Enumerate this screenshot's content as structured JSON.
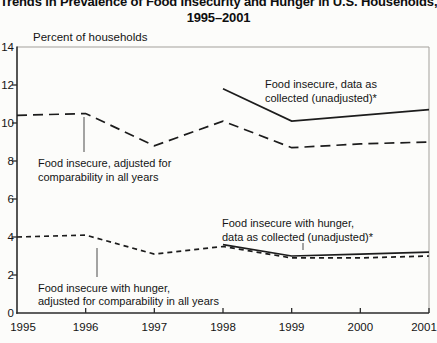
{
  "page": {
    "title_line1": "Trends in Prevalence of Food Insecurity and Hunger in U.S. Households,",
    "title_line2": "1995–2001"
  },
  "chart_data": {
    "type": "line",
    "title": "Trends in Prevalence of Food Insecurity and Hunger in U.S. Households, 1995–2001",
    "ylabel": "Percent of households",
    "xlabel": "",
    "grid": false,
    "legend_position": "inline-annotations",
    "x_range": [
      1995,
      2001
    ],
    "x_categories": [
      "1995",
      "1996",
      "1997",
      "1998",
      "1999",
      "2000",
      "2001"
    ],
    "ylim": [
      0,
      14
    ],
    "y_tick_step": 2,
    "y_tick_labels": [
      "0",
      "2",
      "4",
      "6",
      "8",
      "10",
      "12",
      "14"
    ],
    "line_color": "#1c1c1c",
    "frame_color": "#a3a09b",
    "series": [
      {
        "name": "Food insecure, data as collected (unadjusted)",
        "line_style": "solid",
        "x": [
          1998,
          1999,
          2000,
          2001
        ],
        "values": [
          11.8,
          10.1,
          10.4,
          10.7
        ]
      },
      {
        "name": "Food insecure, adjusted for comparability in all years",
        "line_style": "long-dash",
        "x": [
          1995,
          1996,
          1997,
          1998,
          1999,
          2000,
          2001
        ],
        "values": [
          10.4,
          10.5,
          8.8,
          10.1,
          8.7,
          8.9,
          9.0
        ]
      },
      {
        "name": "Food insecure with hunger, data as collected (unadjusted)",
        "line_style": "solid",
        "x": [
          1998,
          1999,
          2000,
          2001
        ],
        "values": [
          3.6,
          3.0,
          3.1,
          3.2
        ]
      },
      {
        "name": "Food insecure with hunger, adjusted for comparability in all years",
        "line_style": "short-dash",
        "x": [
          1995,
          1996,
          1997,
          1998,
          1999,
          2000,
          2001
        ],
        "values": [
          4.0,
          4.1,
          3.1,
          3.5,
          2.9,
          2.9,
          3.0
        ]
      }
    ],
    "annotations": [
      {
        "id": "label-food-insecure-unadjusted",
        "lines": [
          "Food insecure, data as",
          "collected (unadjusted)*"
        ],
        "x": 265,
        "y": 88,
        "line_height": 14,
        "leader": null
      },
      {
        "id": "label-food-insecure-adjusted",
        "lines": [
          "Food insecure, adjusted for",
          "comparability in all years"
        ],
        "x": 38,
        "y": 167,
        "line_height": 14,
        "leader": {
          "x": 84,
          "y1": 117,
          "y2": 152
        }
      },
      {
        "id": "label-hunger-unadjusted",
        "lines": [
          "Food insecure with hunger,",
          "data as collected (unadjusted)*"
        ],
        "x": 222,
        "y": 227,
        "line_height": 14,
        "leader": {
          "x": 303,
          "y1": 243,
          "y2": 250
        }
      },
      {
        "id": "label-hunger-adjusted",
        "lines": [
          "Food insecure with hunger,",
          "adjusted for comparability in all years"
        ],
        "x": 38,
        "y": 292,
        "line_height": 13,
        "leader": {
          "x": 97,
          "y1": 248,
          "y2": 277
        }
      }
    ],
    "plot_area": {
      "left": 17,
      "top": 47,
      "right": 429,
      "bottom": 313
    }
  }
}
